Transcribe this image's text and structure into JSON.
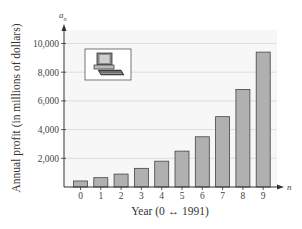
{
  "chart_data": {
    "type": "bar",
    "title": "",
    "xlabel": "Year (0 ↔ 1991)",
    "ylabel": "Annual profit (in millions of dollars)",
    "x_axis_var": "n",
    "y_axis_var": "a_n",
    "categories": [
      "0",
      "1",
      "2",
      "3",
      "4",
      "5",
      "6",
      "7",
      "8",
      "9"
    ],
    "values": [
      420,
      650,
      900,
      1300,
      1800,
      2500,
      3500,
      4900,
      6800,
      9400
    ],
    "yticks": [
      "2,000",
      "4,000",
      "6,000",
      "8,000",
      "10,000"
    ],
    "ylim": [
      0,
      10500
    ],
    "grid": true,
    "legend": null,
    "bar_color": "#b0b0b0",
    "bar_edge_color": "#444444",
    "plot_bg": "#f7f7f7",
    "annotation": "computer-icon"
  },
  "labels": {
    "x_title": "Year (0 ↔ 1991)",
    "y_title": "Annual profit (in millions of dollars)",
    "y_var": "a",
    "y_var_sub": "n",
    "x_var": "n"
  }
}
